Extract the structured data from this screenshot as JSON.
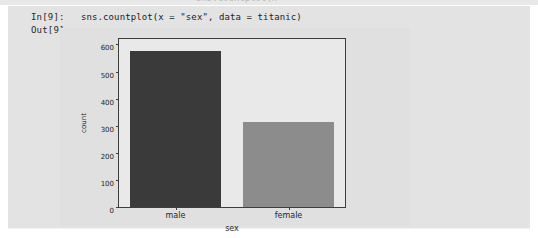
{
  "notebook": {
    "previous_cell_remnant_text": "sns.countplot(x",
    "in_prompt": "In[9]:",
    "out_prompt": "Out[9]:",
    "source": "sns.countplot(x = \"sex\", data = titanic)"
  },
  "colors": {
    "cell_background": "#e3e3e3",
    "figure_background": "#e0e0e0",
    "axes_background": "#e9e9e9",
    "axes_frame": "#3d3d3d",
    "bar_male": "#3a3a3a",
    "bar_female": "#8c8c8c",
    "text": "#1f1f1f"
  },
  "chart_data": {
    "type": "bar",
    "title": "",
    "xlabel": "sex",
    "ylabel": "count",
    "categories": [
      "male",
      "female"
    ],
    "values": [
      577,
      314
    ],
    "bar_colors": [
      "#3a3a3a",
      "#8c8c8c"
    ],
    "ylim": [
      0,
      620
    ],
    "yticks": [
      0,
      100,
      200,
      300,
      400,
      500,
      600
    ],
    "ytick_labels": [
      "0",
      "100",
      "200",
      "300",
      "400",
      "500",
      "600"
    ],
    "grid": false,
    "legend": null
  }
}
